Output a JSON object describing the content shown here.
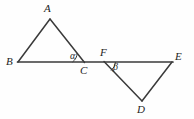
{
  "figure": {
    "background_color": "#fefefe",
    "stroke_color": "#3a3a3a",
    "label_color": "#242424",
    "width": 194,
    "height": 119
  },
  "vertices": {
    "A": {
      "label": "A",
      "x": 50,
      "y": 19,
      "label_x": 44,
      "label_y": 3
    },
    "B": {
      "label": "B",
      "x": 18,
      "y": 62,
      "label_x": 6,
      "label_y": 56
    },
    "C": {
      "label": "C",
      "x": 84,
      "y": 62,
      "label_x": 80,
      "label_y": 65
    },
    "D": {
      "label": "D",
      "x": 142,
      "y": 101,
      "label_x": 137,
      "label_y": 104
    },
    "E": {
      "label": "E",
      "x": 172,
      "y": 62,
      "label_x": 175,
      "label_y": 51
    },
    "F": {
      "label": "F",
      "x": 104,
      "y": 62,
      "label_x": 100,
      "label_y": 47
    }
  },
  "angles": {
    "alpha": {
      "label": "α",
      "at_vertex": "C",
      "label_x": 70,
      "label_y": 51
    },
    "beta": {
      "label": "β",
      "at_vertex": "F",
      "label_x": 113,
      "label_y": 62
    }
  },
  "segments": [
    {
      "name": "segment-BE",
      "from": "B",
      "to": "E",
      "kind": "baseline"
    },
    {
      "name": "segment-AB",
      "from": "A",
      "to": "B",
      "kind": "triangle-side"
    },
    {
      "name": "segment-AC",
      "from": "A",
      "to": "C",
      "kind": "triangle-side"
    },
    {
      "name": "segment-FD",
      "from": "F",
      "to": "D",
      "kind": "triangle-side"
    },
    {
      "name": "segment-DE",
      "from": "D",
      "to": "E",
      "kind": "triangle-side"
    }
  ]
}
